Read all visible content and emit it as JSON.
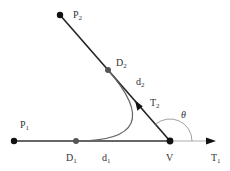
{
  "diagram": {
    "colors": {
      "line": "#222222",
      "thin_line": "#888888",
      "curve": "#666666",
      "point_major": "#111111",
      "point_minor": "#555555",
      "text": "#333333"
    },
    "labels": {
      "p1": {
        "base": "P",
        "sub": "1"
      },
      "p2": {
        "base": "P",
        "sub": "2"
      },
      "d1": {
        "base": "D",
        "sub": "1"
      },
      "d2": {
        "base": "D",
        "sub": "2"
      },
      "d1_len": {
        "base": "d",
        "sub": "1"
      },
      "d2_len": {
        "base": "d",
        "sub": "2"
      },
      "t1": {
        "base": "T",
        "sub": "1"
      },
      "t2": {
        "base": "T",
        "sub": "2"
      },
      "v": "V",
      "theta": "θ"
    }
  }
}
